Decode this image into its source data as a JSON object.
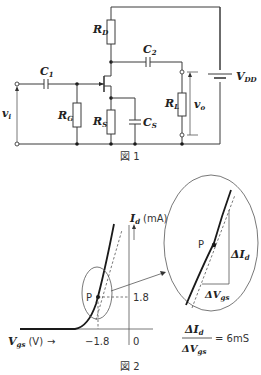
{
  "figure1": {
    "caption": "図 1",
    "components": {
      "RD": {
        "main": "R",
        "sub": "D"
      },
      "C1": {
        "main": "C",
        "sub": "1"
      },
      "C2": {
        "main": "C",
        "sub": "2"
      },
      "RG": {
        "main": "R",
        "sub": "G"
      },
      "RS": {
        "main": "R",
        "sub": "S"
      },
      "CS": {
        "main": "C",
        "sub": "S"
      },
      "RL": {
        "main": "R",
        "sub": "L"
      },
      "VDD": {
        "main": "V",
        "sub": "DD"
      },
      "vi": {
        "main": "v",
        "sub": "i"
      },
      "vo": {
        "main": "v",
        "sub": "o"
      }
    }
  },
  "figure2": {
    "caption": "図 2",
    "y_axis_label": {
      "main": "I",
      "sub": "d",
      "unit": "(mA)"
    },
    "x_axis_label": {
      "main": "V",
      "sub": "gs",
      "unit": "(V)",
      "arrow": "→"
    },
    "point_label": "P",
    "tick_y": "1.8",
    "tick_x": "−1.8",
    "origin": "0",
    "delta_id": {
      "main": "ΔI",
      "sub": "d"
    },
    "delta_vgs": {
      "main": "ΔV",
      "sub": "gs"
    },
    "gm_equation": {
      "rhs": "= 6mS"
    }
  }
}
